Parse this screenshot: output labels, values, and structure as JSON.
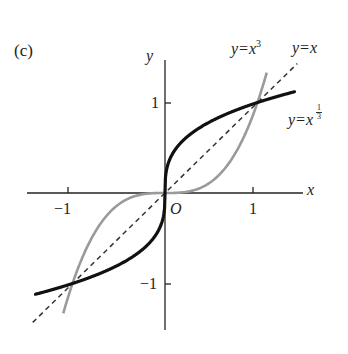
{
  "panel_label": "(c)",
  "axes": {
    "x_label": "x",
    "y_label": "y",
    "origin_label": "O",
    "x_ticks": [
      "−1",
      "1"
    ],
    "y_ticks": [
      "1",
      "−1"
    ]
  },
  "curve_labels": {
    "cubic": {
      "prefix": "y=x",
      "exp": "3"
    },
    "identity": "y=x",
    "cube_root": {
      "prefix": "y=x",
      "num": "1",
      "den": "3"
    }
  },
  "colors": {
    "cube_root": "#111111",
    "cubic": "#9a9a9a",
    "identity": "#333333",
    "axes": "#222222"
  },
  "chart_data": {
    "type": "line",
    "title": "(c)",
    "xlabel": "x",
    "ylabel": "y",
    "xlim": [
      -1.45,
      1.45
    ],
    "ylim": [
      -1.5,
      1.5
    ],
    "grid": false,
    "legend": "inline labels at upper right",
    "annotations": [
      "O",
      "y=x^3",
      "y=x",
      "y=x^(1/3)"
    ],
    "intersections": [
      [
        -1,
        -1
      ],
      [
        0,
        0
      ],
      [
        1,
        1
      ]
    ],
    "series": [
      {
        "name": "y=x^(1/3)",
        "style": "solid thick black",
        "x": [
          -1.4,
          -1,
          -0.5,
          -0.1,
          -0.01,
          0,
          0.01,
          0.1,
          0.5,
          1,
          1.4
        ],
        "y": [
          -1.119,
          -1,
          -0.794,
          -0.464,
          -0.215,
          0,
          0.215,
          0.464,
          0.794,
          1,
          1.119
        ]
      },
      {
        "name": "y=x^3",
        "style": "solid gray",
        "x": [
          -1.1,
          -1,
          -0.5,
          0,
          0.5,
          1,
          1.1
        ],
        "y": [
          -1.331,
          -1,
          -0.125,
          0,
          0.125,
          1,
          1.331
        ]
      },
      {
        "name": "y=x",
        "style": "dashed",
        "x": [
          -1.4,
          0,
          1.4
        ],
        "y": [
          -1.4,
          0,
          1.4
        ]
      }
    ]
  }
}
